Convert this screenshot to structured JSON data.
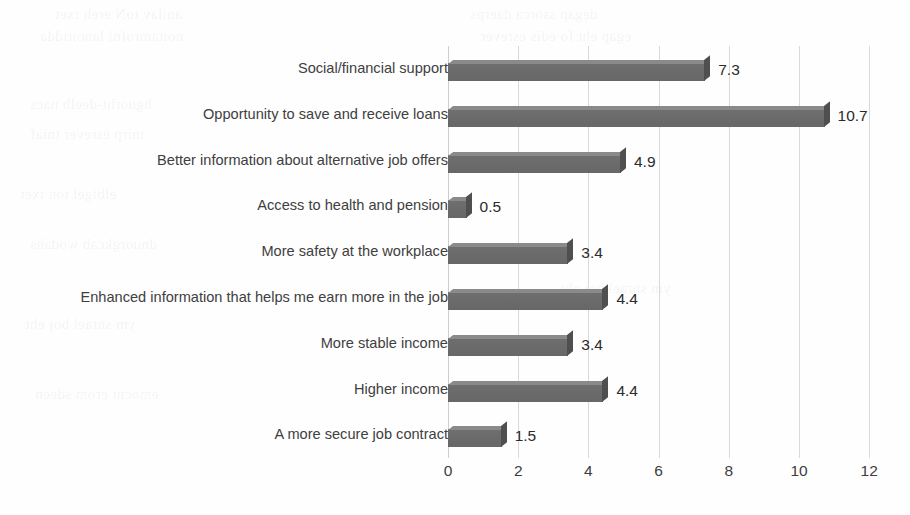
{
  "chart_data": {
    "type": "bar",
    "orientation": "horizontal",
    "title": "",
    "subtitle": "",
    "xlabel": "",
    "ylabel": "",
    "xlim": [
      0,
      12
    ],
    "xticks": [
      "0",
      "2",
      "4",
      "6",
      "8",
      "10",
      "12"
    ],
    "grid": true,
    "legend": "none",
    "bar_color": "#6b6b6b",
    "bar_edge_color": "#4f4f4f",
    "gridline_color": "#d9d9d9",
    "label_color": "#404040",
    "categories": [
      "Social/financial support",
      "Opportunity to save and receive loans",
      "Better information about alternative job offers",
      "Access to health and pension",
      "More safety at the workplace",
      "Enhanced information that helps me earn more in the job",
      "More stable income",
      "Higher income",
      "A more secure job contract"
    ],
    "values": [
      7.3,
      10.7,
      4.9,
      0.5,
      3.4,
      4.4,
      3.4,
      4.4,
      1.5
    ],
    "value_labels": [
      "7.3",
      "10.7",
      "4.9",
      "0.5",
      "3.4",
      "4.4",
      "3.4",
      "4.4",
      "1.5"
    ]
  },
  "background_artifacts": [
    "anilav toN ereh txet",
    "degap ssorca daerps",
    "noitamrofni lanoitidda",
    "egap eht fo edis esrever",
    "hguorht-deelb nacs",
    "tnirp esrever tniaf",
    "elbigel ton txet",
    "dnuorgkcab wodahs",
    "ym snrael boj eht",
    "emocni erom sdeen"
  ]
}
